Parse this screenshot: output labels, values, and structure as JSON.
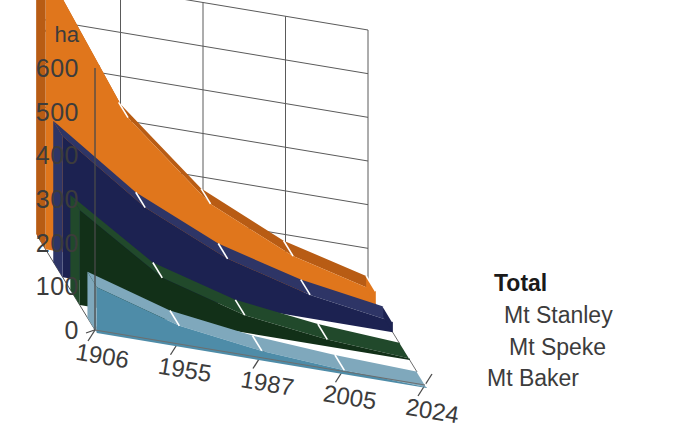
{
  "chart_data": {
    "type": "area",
    "title": "",
    "subtitle": "",
    "xlabel": "",
    "ylabel": "ha",
    "categories": [
      "1906",
      "1955",
      "1987",
      "2005",
      "2024"
    ],
    "ylim": [
      0,
      600
    ],
    "yticks": [
      0,
      100,
      200,
      300,
      400,
      500,
      600
    ],
    "ytick_labels": [
      "0",
      "100",
      "200",
      "300",
      "400",
      "500",
      "600"
    ],
    "grid": true,
    "legend_position": "right-inline",
    "projection": "3d-ribbon",
    "series": [
      {
        "name": "Mt Baker",
        "color": "#4E8CA8",
        "side_color": "#7FA8BC",
        "values": [
          105,
          48,
          22,
          9,
          2
        ]
      },
      {
        "name": "Mt Speke",
        "color": "#123018",
        "side_color": "#21492B",
        "values": [
          217,
          94,
          40,
          16,
          4
        ]
      },
      {
        "name": "Mt Stanley",
        "color": "#1C2251",
        "side_color": "#2E3566",
        "values": [
          323,
          191,
          105,
          54,
          24
        ]
      },
      {
        "name": "Total",
        "color": "#E0761C",
        "side_color": "#B85C14",
        "values": [
          645,
          333,
          167,
          79,
          30
        ]
      }
    ]
  },
  "axis": {
    "unit": "ha",
    "y_labels": [
      "600",
      "500",
      "400",
      "300",
      "200",
      "100",
      "0"
    ],
    "x_labels": [
      "1906",
      "1955",
      "1987",
      "2005",
      "2024"
    ]
  },
  "legend": {
    "items": [
      {
        "label": "Total",
        "emphasis": "bold"
      },
      {
        "label": "Mt Stanley",
        "emphasis": "normal"
      },
      {
        "label": "Mt Speke",
        "emphasis": "normal"
      },
      {
        "label": "Mt Baker",
        "emphasis": "normal"
      }
    ]
  }
}
